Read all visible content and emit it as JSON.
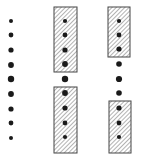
{
  "diagram": {
    "width": 144,
    "height": 165,
    "colors": {
      "dot": "#1a1a1a",
      "hatch": "#8a8a8a",
      "box_border": "#444444",
      "background": "#ffffff"
    },
    "columns": [
      {
        "name": "column-left",
        "x": 11,
        "dots": [
          {
            "y": 21,
            "r": 2.0
          },
          {
            "y": 35,
            "r": 2.4
          },
          {
            "y": 50,
            "r": 2.6
          },
          {
            "y": 65,
            "r": 2.9
          },
          {
            "y": 79,
            "r": 3.2
          },
          {
            "y": 94,
            "r": 2.9
          },
          {
            "y": 109,
            "r": 2.6
          },
          {
            "y": 123,
            "r": 2.4
          },
          {
            "y": 138,
            "r": 2.0
          }
        ],
        "boxes": []
      },
      {
        "name": "column-middle",
        "x": 65,
        "dots": [
          {
            "y": 21,
            "r": 2.1
          },
          {
            "y": 35,
            "r": 2.4
          },
          {
            "y": 50,
            "r": 2.6
          },
          {
            "y": 64,
            "r": 2.9
          },
          {
            "y": 79,
            "r": 3.2
          },
          {
            "y": 93,
            "r": 2.9
          },
          {
            "y": 108,
            "r": 2.6
          },
          {
            "y": 123,
            "r": 2.4
          },
          {
            "y": 137,
            "r": 2.1
          }
        ],
        "boxes": [
          {
            "x": 54,
            "y": 7,
            "w": 23,
            "h": 65
          },
          {
            "x": 54,
            "y": 87,
            "w": 23,
            "h": 66
          }
        ]
      },
      {
        "name": "column-right",
        "x": 119,
        "dots": [
          {
            "y": 21,
            "r": 2.1
          },
          {
            "y": 35,
            "r": 2.4
          },
          {
            "y": 49,
            "r": 2.6
          },
          {
            "y": 64,
            "r": 2.8
          },
          {
            "y": 79,
            "r": 3.1
          },
          {
            "y": 93,
            "r": 2.8
          },
          {
            "y": 108,
            "r": 2.6
          },
          {
            "y": 123,
            "r": 2.4
          },
          {
            "y": 137,
            "r": 2.1
          }
        ],
        "boxes": [
          {
            "x": 108,
            "y": 7,
            "w": 22,
            "h": 50
          },
          {
            "x": 109,
            "y": 101,
            "w": 22,
            "h": 52
          }
        ]
      }
    ]
  }
}
